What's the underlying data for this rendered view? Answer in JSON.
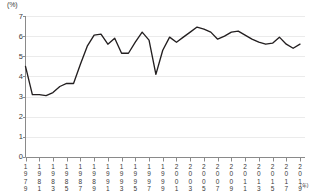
{
  "chart_data": {
    "type": "line",
    "title": "",
    "subtitle": "",
    "xlabel": "",
    "ylabel": "",
    "unit_label": "(%)",
    "x_axis_suffix": "(年)",
    "ylim": [
      0,
      7
    ],
    "yticks": [
      0,
      1,
      2,
      3,
      4,
      5,
      6,
      7
    ],
    "ytick_labels": [
      "0",
      "1",
      "2",
      "3",
      "4",
      "5",
      "6",
      "7"
    ],
    "xlim": [
      1979,
      2019
    ],
    "xticks": [
      1979,
      1981,
      1983,
      1985,
      1987,
      1989,
      1991,
      1993,
      1995,
      1997,
      1999,
      2001,
      2003,
      2005,
      2007,
      2009,
      2011,
      2013,
      2015,
      2017,
      2019
    ],
    "xtick_labels": [
      "1979",
      "1981",
      "1983",
      "1985",
      "1987",
      "1989",
      "1991",
      "1993",
      "1995",
      "1997",
      "1999",
      "2001",
      "2003",
      "2005",
      "2007",
      "2009",
      "2011",
      "2013",
      "2015",
      "2017",
      "2019"
    ],
    "grid": true,
    "grid_orientation": "horizontal",
    "legend": false,
    "legend_position": "none",
    "line_color": "#231f20",
    "grid_color": "#ebebeb",
    "axis_color": "#8a8a8a",
    "background_color": "#ffffff",
    "x": [
      1979,
      1980,
      1981,
      1982,
      1983,
      1984,
      1985,
      1986,
      1987,
      1988,
      1989,
      1990,
      1991,
      1992,
      1993,
      1994,
      1995,
      1996,
      1997,
      1998,
      1999,
      2000,
      2001,
      2002,
      2003,
      2004,
      2005,
      2006,
      2007,
      2008,
      2009,
      2010,
      2011,
      2012,
      2013,
      2014,
      2015,
      2016,
      2017,
      2018,
      2019
    ],
    "values": [
      4.5,
      3.1,
      3.1,
      3.05,
      3.2,
      3.5,
      3.65,
      3.65,
      4.6,
      5.5,
      6.05,
      6.1,
      5.6,
      5.9,
      5.15,
      5.15,
      5.7,
      6.2,
      5.8,
      4.1,
      5.3,
      5.95,
      5.7,
      5.95,
      6.2,
      6.45,
      6.35,
      6.2,
      5.85,
      6.0,
      6.2,
      6.25,
      6.05,
      5.85,
      5.7,
      5.6,
      5.65,
      5.95,
      5.6,
      5.4,
      5.6
    ],
    "series_name": ""
  }
}
